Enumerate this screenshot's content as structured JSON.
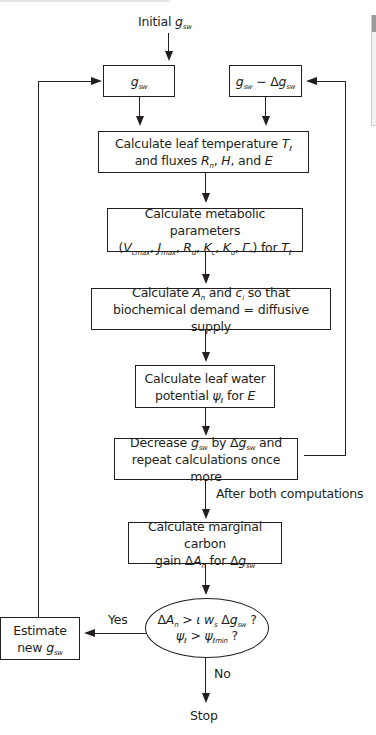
{
  "diagram": {
    "type": "flowchart",
    "start_label": {
      "prefix": "Initial ",
      "var": "g",
      "sub": "sw"
    },
    "nodes": {
      "gsw": {
        "var": "g",
        "sub": "sw"
      },
      "gsw_minus": {
        "var1": "g",
        "sub1": "sw",
        "op": " − Δ",
        "var2": "g",
        "sub2": "sw"
      },
      "leaf_temp": {
        "line1": "Calculate leaf temperature ",
        "T": "T",
        "T_sub": "ℓ",
        "line2a": "and fluxes ",
        "R": "R",
        "R_sub": "n",
        "comma1": ", ",
        "H": "H",
        "line2b": ", and ",
        "E": "E"
      },
      "metabolic": {
        "line1": "Calculate metabolic parameters",
        "open": "(",
        "V": "V",
        "V_sub": "cmax",
        "J": "J",
        "J_sub": "max",
        "R": "R",
        "R_sub": "d",
        "Kc": "K",
        "Kc_sub": "c",
        "Ko": "K",
        "Ko_sub": "o",
        "G": "Γ",
        "G_sub": "*",
        "close": ") for ",
        "T": "T",
        "T_sub": "ℓ",
        "sep": ", "
      },
      "an_ci": {
        "line1a": "Calculate ",
        "A": "A",
        "A_sub": "n",
        "mid": " and ",
        "c": "c",
        "c_sub": "i",
        "line1b": " so that",
        "line2": "biochemical demand = diffusive supply"
      },
      "water_potential": {
        "line1": "Calculate leaf water",
        "line2a": "potential ",
        "psi": "ψ",
        "psi_sub": "ℓ",
        "line2b": " for ",
        "E": "E"
      },
      "decrease": {
        "line1a": "Decrease ",
        "g": "g",
        "g_sub": "sw",
        "line1b": " by Δ",
        "g2": "g",
        "g2_sub": "sw",
        "line1c": " and",
        "line2": "repeat calculations once more"
      },
      "after_label": "After both computations",
      "marginal": {
        "line1": "Calculate marginal carbon",
        "line2a": "gain Δ",
        "A": "A",
        "A_sub": "n",
        "line2b": " for Δ",
        "g": "g",
        "g_sub": "sw"
      },
      "decision": {
        "line1a": "Δ",
        "A": "A",
        "A_sub": "n",
        "gt": " > ",
        "iota": "ι",
        "w": " w",
        "w_sub": "s",
        "d": " Δ",
        "g": "g",
        "g_sub": "sw",
        "q1": " ?",
        "psi": "ψ",
        "psi_sub": "ℓ",
        "gt2": " > ",
        "psi2": "ψ",
        "psi2_sub": "ℓmin",
        "q2": " ?"
      },
      "estimate": {
        "line1": "Estimate",
        "line2a": "new ",
        "g": "g",
        "g_sub": "sw"
      },
      "yes_label": "Yes",
      "no_label": "No",
      "stop_label": "Stop"
    }
  },
  "ui": {
    "scrollbar": {
      "track_color": "#f2f2f2",
      "thumb_color": "#9a9a9a"
    }
  }
}
